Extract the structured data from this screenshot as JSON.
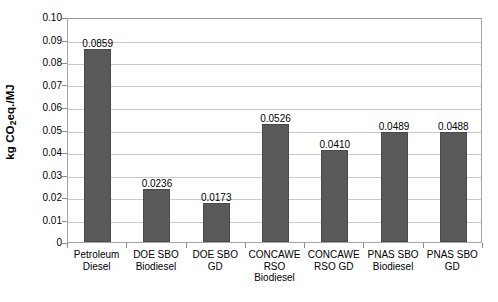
{
  "chart_data": {
    "type": "bar",
    "title": "",
    "subtitle": "",
    "xlabel": "",
    "ylabel": "kg CO2eq./MJ",
    "ylabel_parts": {
      "prefix": "kg CO",
      "subscript": "2",
      "suffix": "eq./MJ"
    },
    "ylim": [
      0,
      0.1
    ],
    "ytick_step": 0.01,
    "ytick_labels": [
      "0.10",
      "0.09",
      "0.08",
      "0.07",
      "0.06",
      "0.05",
      "0.04",
      "0.03",
      "0.02",
      "0.01",
      "0"
    ],
    "ytick_values": [
      0.1,
      0.09,
      0.08,
      0.07,
      0.06,
      0.05,
      0.04,
      0.03,
      0.02,
      0.01,
      0
    ],
    "grid": true,
    "grid_axis": "y",
    "legend": false,
    "legend_position": "none",
    "bar_color": "#595959",
    "gridline_color": "#c9c9c9",
    "frame_color": "#a6a6a6",
    "categories": [
      "Petroleum Diesel",
      "DOE SBO Biodiesel",
      "DOE SBO GD",
      "CONCAWE RSO Biodiesel",
      "CONCAWE RSO GD",
      "PNAS SBO Biodiesel",
      "PNAS SBO GD"
    ],
    "category_lines": [
      [
        "Petroleum",
        "Diesel"
      ],
      [
        "DOE SBO",
        "Biodiesel"
      ],
      [
        "DOE SBO",
        "GD"
      ],
      [
        "CONCAWE",
        "RSO",
        "Biodiesel"
      ],
      [
        "CONCAWE",
        "RSO GD"
      ],
      [
        "PNAS SBO",
        "Biodiesel"
      ],
      [
        "PNAS SBO",
        "GD"
      ]
    ],
    "values": [
      0.0859,
      0.0236,
      0.0173,
      0.0526,
      0.041,
      0.0489,
      0.0488
    ],
    "data_labels": [
      "0.0859",
      "0.0236",
      "0.0173",
      "0.0526",
      "0.0410",
      "0.0489",
      "0.0488"
    ]
  }
}
